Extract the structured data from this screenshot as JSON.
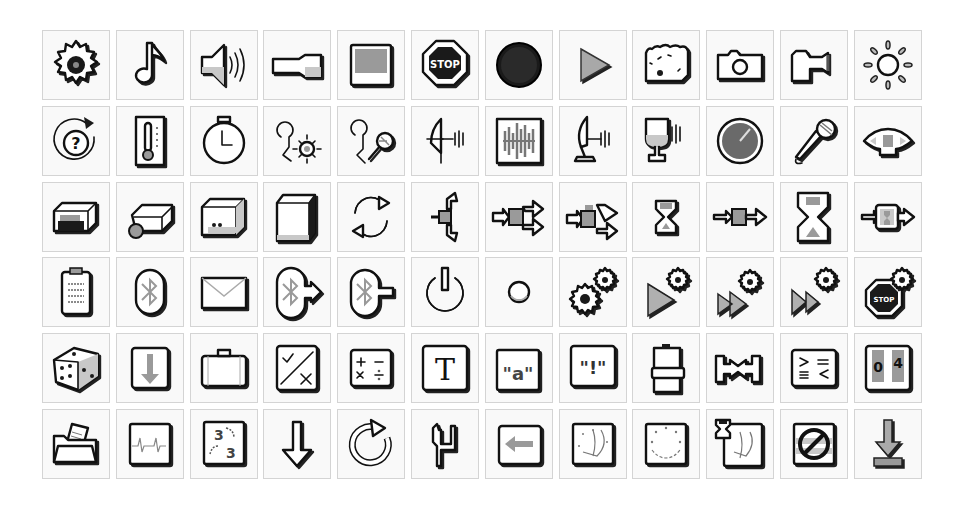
{
  "palette": {
    "background": "#ffffff",
    "cell_bg": "#f9f9f9",
    "cell_border": "#d4d4d4",
    "ink": "#111111",
    "mid_gray": "#9a9a9a"
  },
  "grid": {
    "columns": 12,
    "rows": 6
  },
  "icons": [
    {
      "row": 1,
      "col": 1,
      "name": "gear-icon"
    },
    {
      "row": 1,
      "col": 2,
      "name": "music-note-icon"
    },
    {
      "row": 1,
      "col": 3,
      "name": "speaker-sound-icon"
    },
    {
      "row": 1,
      "col": 4,
      "name": "flashlight-icon"
    },
    {
      "row": 1,
      "col": 5,
      "name": "display-screen-icon"
    },
    {
      "row": 1,
      "col": 6,
      "name": "stop-sign-icon",
      "label": "STOP"
    },
    {
      "row": 1,
      "col": 7,
      "name": "black-circle-record-icon"
    },
    {
      "row": 1,
      "col": 8,
      "name": "play-triangle-icon"
    },
    {
      "row": 1,
      "col": 9,
      "name": "bread-loaf-icon"
    },
    {
      "row": 1,
      "col": 10,
      "name": "camera-icon"
    },
    {
      "row": 1,
      "col": 11,
      "name": "projector-icon"
    },
    {
      "row": 1,
      "col": 12,
      "name": "sun-light-icon"
    },
    {
      "row": 2,
      "col": 1,
      "name": "question-rotate-icon",
      "label": "?"
    },
    {
      "row": 2,
      "col": 2,
      "name": "thermometer-icon"
    },
    {
      "row": 2,
      "col": 3,
      "name": "stopwatch-icon"
    },
    {
      "row": 2,
      "col": 4,
      "name": "light-sensor-probe-icon"
    },
    {
      "row": 2,
      "col": 5,
      "name": "sound-sensor-probe-icon"
    },
    {
      "row": 2,
      "col": 6,
      "name": "ultrasonic-sensor-icon"
    },
    {
      "row": 2,
      "col": 7,
      "name": "sound-wave-icon"
    },
    {
      "row": 2,
      "col": 8,
      "name": "satellite-dish-sensor-icon"
    },
    {
      "row": 2,
      "col": 9,
      "name": "cup-speaker-icon"
    },
    {
      "row": 2,
      "col": 10,
      "name": "gauge-dial-icon"
    },
    {
      "row": 2,
      "col": 11,
      "name": "microphone-icon"
    },
    {
      "row": 2,
      "col": 12,
      "name": "color-sensor-icon"
    },
    {
      "row": 3,
      "col": 1,
      "name": "brick-motor-icon"
    },
    {
      "row": 3,
      "col": 2,
      "name": "brick-servo-icon"
    },
    {
      "row": 3,
      "col": 3,
      "name": "brick-block-icon"
    },
    {
      "row": 3,
      "col": 4,
      "name": "brick-tall-icon"
    },
    {
      "row": 3,
      "col": 5,
      "name": "loop-arrows-icon"
    },
    {
      "row": 3,
      "col": 6,
      "name": "switch-branch-icon"
    },
    {
      "row": 3,
      "col": 7,
      "name": "fork-arrows-icon"
    },
    {
      "row": 3,
      "col": 8,
      "name": "fork-arrows-alt-icon"
    },
    {
      "row": 3,
      "col": 9,
      "name": "hourglass-small-icon"
    },
    {
      "row": 3,
      "col": 10,
      "name": "pass-through-icon"
    },
    {
      "row": 3,
      "col": 11,
      "name": "hourglass-large-icon"
    },
    {
      "row": 3,
      "col": 12,
      "name": "wait-block-icon"
    },
    {
      "row": 4,
      "col": 1,
      "name": "clipboard-icon"
    },
    {
      "row": 4,
      "col": 2,
      "name": "bluetooth-icon"
    },
    {
      "row": 4,
      "col": 3,
      "name": "envelope-icon"
    },
    {
      "row": 4,
      "col": 4,
      "name": "bluetooth-send-icon"
    },
    {
      "row": 4,
      "col": 5,
      "name": "bluetooth-receive-icon"
    },
    {
      "row": 4,
      "col": 6,
      "name": "power-icon"
    },
    {
      "row": 4,
      "col": 7,
      "name": "small-circle-icon"
    },
    {
      "row": 4,
      "col": 8,
      "name": "gears-icon"
    },
    {
      "row": 4,
      "col": 9,
      "name": "play-gear-icon"
    },
    {
      "row": 4,
      "col": 10,
      "name": "fast-forward-gear-icon"
    },
    {
      "row": 4,
      "col": 11,
      "name": "skip-gear-icon"
    },
    {
      "row": 4,
      "col": 12,
      "name": "stop-gear-icon",
      "label": "STOP"
    },
    {
      "row": 5,
      "col": 1,
      "name": "dice-icon"
    },
    {
      "row": 5,
      "col": 2,
      "name": "down-arrow-box-icon"
    },
    {
      "row": 5,
      "col": 3,
      "name": "briefcase-icon"
    },
    {
      "row": 5,
      "col": 4,
      "name": "logic-check-x-icon"
    },
    {
      "row": 5,
      "col": 5,
      "name": "math-operators-icon",
      "label": "+ − × ÷"
    },
    {
      "row": 5,
      "col": 6,
      "name": "text-t-icon",
      "label": "T"
    },
    {
      "row": 5,
      "col": 7,
      "name": "text-variable-icon",
      "label": "\"a\""
    },
    {
      "row": 5,
      "col": 8,
      "name": "exclamation-text-icon",
      "label": "\"!\""
    },
    {
      "row": 5,
      "col": 9,
      "name": "battery-icon"
    },
    {
      "row": 5,
      "col": 10,
      "name": "range-icon"
    },
    {
      "row": 5,
      "col": 11,
      "name": "compare-icon",
      "label": "> = ≡ <"
    },
    {
      "row": 5,
      "col": 12,
      "name": "number-display-icon",
      "label": "0 4"
    },
    {
      "row": 6,
      "col": 1,
      "name": "open-folder-icon"
    },
    {
      "row": 6,
      "col": 2,
      "name": "waveform-graph-icon"
    },
    {
      "row": 6,
      "col": 3,
      "name": "number-convert-icon",
      "label": "3 → 3\""
    },
    {
      "row": 6,
      "col": 4,
      "name": "down-arrow-icon"
    },
    {
      "row": 6,
      "col": 5,
      "name": "rotate-arrow-icon"
    },
    {
      "row": 6,
      "col": 6,
      "name": "step-shape-icon"
    },
    {
      "row": 6,
      "col": 7,
      "name": "left-arrow-box-icon"
    },
    {
      "row": 6,
      "col": 8,
      "name": "curve-graph-icon"
    },
    {
      "row": 6,
      "col": 9,
      "name": "circle-dots-graph-icon"
    },
    {
      "row": 6,
      "col": 10,
      "name": "timed-curve-graph-icon"
    },
    {
      "row": 6,
      "col": 11,
      "name": "prohibited-icon"
    },
    {
      "row": 6,
      "col": 12,
      "name": "download-arrow-icon"
    }
  ]
}
